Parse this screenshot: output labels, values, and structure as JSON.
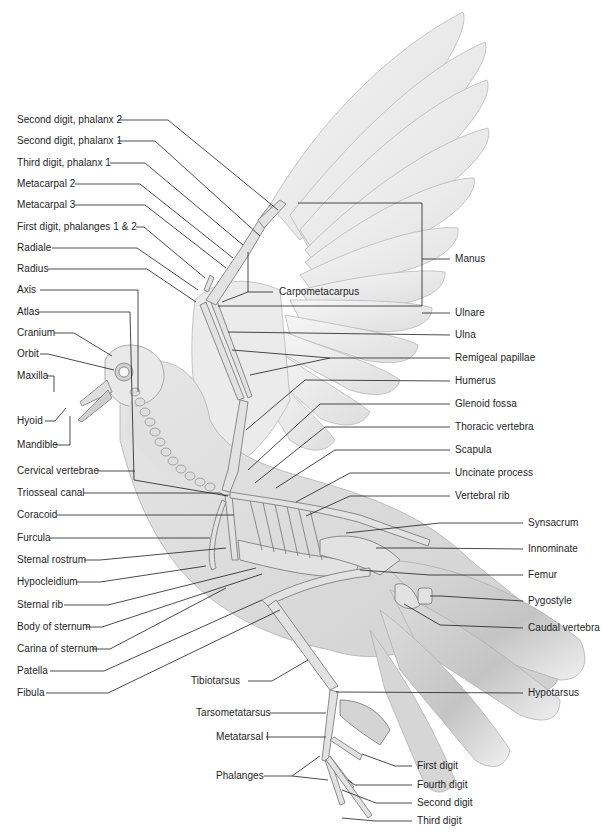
{
  "labels_left": [
    {
      "id": "second-digit-phalanx-2",
      "text": "Second digit, phalanx 2",
      "y": 120
    },
    {
      "id": "second-digit-phalanx-1",
      "text": "Second digit, phalanx 1",
      "y": 141
    },
    {
      "id": "third-digit-phalanx-1",
      "text": "Third digit, phalanx 1",
      "y": 163
    },
    {
      "id": "metacarpal-2",
      "text": "Metacarpal 2",
      "y": 184
    },
    {
      "id": "metacarpal-3",
      "text": "Metacarpal 3",
      "y": 205
    },
    {
      "id": "first-digit-phalanges",
      "text": "First digit, phalanges 1 & 2",
      "y": 227
    },
    {
      "id": "radiale",
      "text": "Radiale",
      "y": 248
    },
    {
      "id": "radius",
      "text": "Radius",
      "y": 269
    },
    {
      "id": "axis",
      "text": "Axis",
      "y": 290
    },
    {
      "id": "atlas",
      "text": "Atlas",
      "y": 312
    },
    {
      "id": "cranium",
      "text": "Cranium",
      "y": 333
    },
    {
      "id": "orbit",
      "text": "Orbit",
      "y": 354
    },
    {
      "id": "maxilla",
      "text": "Maxilla",
      "y": 376
    },
    {
      "id": "hyoid",
      "text": "Hyoid",
      "y": 421
    },
    {
      "id": "mandible",
      "text": "Mandible",
      "y": 445
    },
    {
      "id": "cervical-vertebrae",
      "text": "Cervical vertebrae",
      "y": 471
    },
    {
      "id": "triosseal-canal",
      "text": "Triosseal canal",
      "y": 493
    },
    {
      "id": "coracoid",
      "text": "Coracoid",
      "y": 515
    },
    {
      "id": "furcula",
      "text": "Furcula",
      "y": 538
    },
    {
      "id": "sternal-rostrum",
      "text": "Sternal rostrum",
      "y": 560
    },
    {
      "id": "hypocleidium",
      "text": "Hypocleidium",
      "y": 582
    },
    {
      "id": "sternal-rib",
      "text": "Sternal rib",
      "y": 605
    },
    {
      "id": "body-of-sternum",
      "text": "Body of sternum",
      "y": 627
    },
    {
      "id": "carina-of-sternum",
      "text": "Carina of sternum",
      "y": 649
    },
    {
      "id": "patella",
      "text": "Patella",
      "y": 671
    },
    {
      "id": "fibula",
      "text": "Fibula",
      "y": 693
    }
  ],
  "labels_right": [
    {
      "id": "carpometacarpus",
      "text": "Carpometacarpus",
      "x": 279,
      "y": 292
    },
    {
      "id": "manus",
      "text": "Manus",
      "x": 455,
      "y": 259
    },
    {
      "id": "ulnare",
      "text": "Ulnare",
      "x": 455,
      "y": 313
    },
    {
      "id": "ulna",
      "text": "Ulna",
      "x": 455,
      "y": 335
    },
    {
      "id": "remigeal-papillae",
      "text": "Remigeal papillae",
      "x": 455,
      "y": 358
    },
    {
      "id": "humerus",
      "text": "Humerus",
      "x": 455,
      "y": 381
    },
    {
      "id": "glenoid-fossa",
      "text": "Glenoid fossa",
      "x": 455,
      "y": 404
    },
    {
      "id": "thoracic-vertebra",
      "text": "Thoracic vertebra",
      "x": 455,
      "y": 427
    },
    {
      "id": "scapula",
      "text": "Scapula",
      "x": 455,
      "y": 450
    },
    {
      "id": "uncinate-process",
      "text": "Uncinate process",
      "x": 455,
      "y": 473
    },
    {
      "id": "vertebral-rib",
      "text": "Vertebral rib",
      "x": 455,
      "y": 496
    },
    {
      "id": "synsacrum",
      "text": "Synsacrum",
      "x": 528,
      "y": 523
    },
    {
      "id": "innominate",
      "text": "Innominate",
      "x": 528,
      "y": 549
    },
    {
      "id": "femur",
      "text": "Femur",
      "x": 528,
      "y": 575
    },
    {
      "id": "pygostyle",
      "text": "Pygostyle",
      "x": 528,
      "y": 601
    },
    {
      "id": "caudal-vertebra",
      "text": "Caudal vertebra",
      "x": 528,
      "y": 628
    },
    {
      "id": "hypotarsus",
      "text": "Hypotarsus",
      "x": 528,
      "y": 693
    }
  ],
  "labels_bottom": [
    {
      "id": "tibiotarsus",
      "text": "Tibiotarsus",
      "x": 191,
      "y": 681
    },
    {
      "id": "tarsometatarsus",
      "text": "Tarsometatarsus",
      "x": 196,
      "y": 713
    },
    {
      "id": "metatarsal-i",
      "text": "Metatarsal I",
      "x": 216,
      "y": 737
    },
    {
      "id": "phalanges",
      "text": "Phalanges",
      "x": 216,
      "y": 776
    },
    {
      "id": "first-digit",
      "text": "First digit",
      "x": 417,
      "y": 766
    },
    {
      "id": "fourth-digit",
      "text": "Fourth digit",
      "x": 417,
      "y": 785
    },
    {
      "id": "second-digit",
      "text": "Second digit",
      "x": 417,
      "y": 803
    },
    {
      "id": "third-digit",
      "text": "Third digit",
      "x": 417,
      "y": 821
    }
  ],
  "colors": {
    "background": "#ffffff",
    "feather_fill": "#ededed",
    "feather_stroke": "#b5b5b5",
    "bone_fill": "#e4e4e4",
    "bone_stroke": "#8a8a8a",
    "body_shade": "#d9d9d9",
    "leader_line": "#1e1e1e",
    "text": "#1e1e1e"
  }
}
